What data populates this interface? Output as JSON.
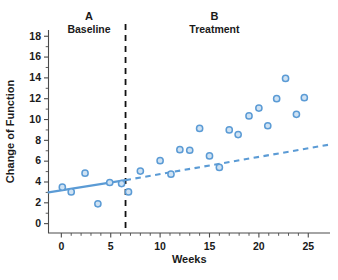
{
  "chart_data": {
    "type": "scatter",
    "title": "",
    "xlabel": "Weeks",
    "ylabel": "Change of Function",
    "xlim": [
      -1.3,
      27.2
    ],
    "ylim": [
      -0.9,
      18.6
    ],
    "grid": false,
    "legend": "none",
    "x_ticks": [
      0,
      5,
      10,
      15,
      20,
      25
    ],
    "x_tick_labels": [
      "0",
      "5",
      "10",
      "15",
      "20",
      "25"
    ],
    "x_minor_tick_step": 1,
    "y_ticks": [
      0,
      2,
      4,
      6,
      8,
      10,
      12,
      14,
      16,
      18
    ],
    "y_tick_labels": [
      "0",
      "2",
      "4",
      "6",
      "8",
      "10",
      "12",
      "14",
      "16",
      "18"
    ],
    "marker_fill_color": "#cfe2f3",
    "marker_edge_color": "#5b9bd5",
    "marker_radius": 3.1,
    "series": [
      {
        "name": "Baseline observations",
        "phase": "A",
        "points": [
          {
            "x": 0.1,
            "y": 3.5
          },
          {
            "x": 1.0,
            "y": 3.05
          },
          {
            "x": 2.4,
            "y": 4.85
          },
          {
            "x": 3.7,
            "y": 1.9
          },
          {
            "x": 4.9,
            "y": 3.95
          },
          {
            "x": 6.1,
            "y": 3.85
          }
        ]
      },
      {
        "name": "Treatment observations",
        "phase": "B",
        "points": [
          {
            "x": 6.8,
            "y": 3.05
          },
          {
            "x": 8.0,
            "y": 5.05
          },
          {
            "x": 10.0,
            "y": 6.05
          },
          {
            "x": 11.1,
            "y": 4.75
          },
          {
            "x": 12.0,
            "y": 7.1
          },
          {
            "x": 13.0,
            "y": 7.05
          },
          {
            "x": 14.0,
            "y": 9.15
          },
          {
            "x": 15.0,
            "y": 6.5
          },
          {
            "x": 16.0,
            "y": 5.4
          },
          {
            "x": 17.0,
            "y": 9.0
          },
          {
            "x": 17.9,
            "y": 8.55
          },
          {
            "x": 19.0,
            "y": 10.35
          },
          {
            "x": 20.0,
            "y": 11.1
          },
          {
            "x": 20.9,
            "y": 9.4
          },
          {
            "x": 21.8,
            "y": 12.0
          },
          {
            "x": 22.7,
            "y": 13.95
          },
          {
            "x": 23.8,
            "y": 10.5
          },
          {
            "x": 24.6,
            "y": 12.1
          }
        ]
      }
    ],
    "trend_lines": [
      {
        "name": "baseline-trend",
        "style": "solid",
        "color": "#5b9bd5",
        "x_start": -1.3,
        "y_start": 3.0,
        "x_end": 6.5,
        "y_end": 4.18
      },
      {
        "name": "projected-trend",
        "style": "dashed",
        "color": "#5b9bd5",
        "x_start": 6.5,
        "y_start": 4.18,
        "x_end": 27.2,
        "y_end": 7.6
      }
    ],
    "phase_divider": {
      "x": 6.5,
      "style": "dashed",
      "color": "#111111"
    },
    "annotations": [
      {
        "name": "phase-a",
        "letter": "A",
        "label": "Baseline",
        "x": 2.8
      },
      {
        "name": "phase-b",
        "letter": "B",
        "label": "Treatment",
        "x": 15.5
      }
    ]
  }
}
